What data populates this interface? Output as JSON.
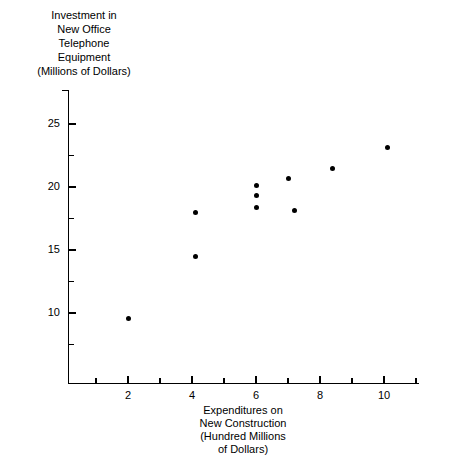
{
  "chart_data": {
    "type": "scatter",
    "title": "",
    "ylabel_lines": [
      "Investment in",
      "New Office",
      "Telephone",
      "Equipment",
      "(Millions of Dollars)"
    ],
    "xlabel_lines": [
      "Expenditures on",
      "New Construction",
      "(Hundred Millions",
      "of Dollars)"
    ],
    "xlabel": "Expenditures on New Construction (Hundred Millions of Dollars)",
    "ylabel": "Investment in New Office Telephone Equipment (Millions of Dollars)",
    "xlim": [
      0,
      11.1
    ],
    "ylim": [
      5.4,
      27.7
    ],
    "grid": false,
    "legend": false,
    "x_major_ticks": [
      2,
      4,
      6,
      8,
      10
    ],
    "x_major_tick_labels": [
      "2",
      "4",
      "6",
      "8",
      "10"
    ],
    "x_minor_ticks": [
      1,
      3,
      5,
      7,
      9,
      11
    ],
    "y_major_ticks": [
      10,
      15,
      20,
      25
    ],
    "y_major_tick_labels": [
      "10",
      "15",
      "20",
      "25"
    ],
    "y_minor_ticks": [
      7.5,
      12.5,
      17.5,
      22.5
    ],
    "marker": "filled-circle",
    "marker_color": "#000000",
    "axis_color": "#000000",
    "x": [
      2.0,
      4.1,
      4.1,
      6.0,
      6.0,
      6.0,
      7.0,
      7.2,
      8.4,
      10.1
    ],
    "y": [
      9.6,
      14.5,
      18.0,
      20.1,
      19.3,
      18.4,
      20.7,
      18.1,
      21.5,
      23.1
    ],
    "points": [
      {
        "x": 2.0,
        "y": 9.6
      },
      {
        "x": 4.1,
        "y": 14.5
      },
      {
        "x": 4.1,
        "y": 18.0
      },
      {
        "x": 6.0,
        "y": 20.1
      },
      {
        "x": 6.0,
        "y": 19.3
      },
      {
        "x": 6.0,
        "y": 18.4
      },
      {
        "x": 7.0,
        "y": 20.7
      },
      {
        "x": 7.2,
        "y": 18.1
      },
      {
        "x": 8.4,
        "y": 21.5
      },
      {
        "x": 10.1,
        "y": 23.1
      }
    ]
  },
  "axes_geometry": {
    "x_origin_px": 64,
    "y_zero_px": 439,
    "px_per_x_unit": 32,
    "px_per_y_unit": 12.6,
    "x_axis_y_px": 383,
    "y_axis_x_px": 68,
    "y_axis_top_px": 90,
    "x_axis_right_px": 419
  }
}
